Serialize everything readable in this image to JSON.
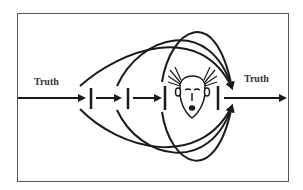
{
  "diagram": {
    "labels": {
      "input": "Truth",
      "output": "Truth"
    },
    "nodes": [
      {
        "id": "barrier-1",
        "type": "filter-bar"
      },
      {
        "id": "barrier-2",
        "type": "filter-bar"
      },
      {
        "id": "barrier-3",
        "type": "filter-bar"
      },
      {
        "id": "person",
        "type": "worried-face"
      },
      {
        "id": "barrier-4",
        "type": "filter-bar"
      }
    ],
    "colors": {
      "stroke": "#1a1a1a",
      "frame": "#555555",
      "background": "#ffffff"
    }
  }
}
